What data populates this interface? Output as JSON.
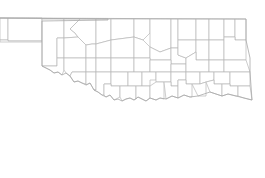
{
  "map": {
    "title": "Oklahoma counties",
    "region": "Oklahoma",
    "feature_type": "county boundaries",
    "stroke_color": "#b8b8b8",
    "fill_color": "#ffffff",
    "background_color": "#ffffff",
    "county_count": 77
  }
}
